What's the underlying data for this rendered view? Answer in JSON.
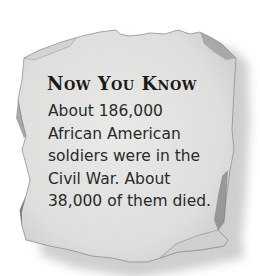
{
  "callout": {
    "title": "Now You Know",
    "lines": [
      "About 186,000",
      "African American",
      "soldiers were in the",
      "Civil War. About",
      "38,000 of them died."
    ]
  },
  "colors": {
    "paper": "#e6e6e4",
    "paper_edge": "#9a9a98",
    "shadow": "#bdbdbd",
    "text": "#2a2a2a"
  }
}
